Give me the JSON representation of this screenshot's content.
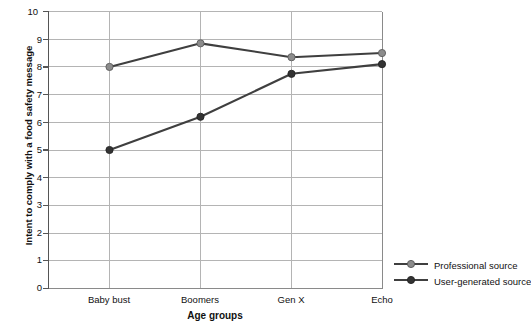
{
  "chart_data": {
    "type": "line",
    "title": "",
    "xlabel": "Age groups",
    "ylabel": "Intent to comply with a food safety message",
    "categories": [
      "Baby bust",
      "Boomers",
      "Gen X",
      "Echo"
    ],
    "ylim": [
      0,
      10
    ],
    "yticks": [
      "0",
      "1",
      "2",
      "3",
      "4",
      "5",
      "6",
      "7",
      "8",
      "9",
      "10"
    ],
    "grid": true,
    "legend_position": "right-bottom",
    "series": [
      {
        "name": "Professional source",
        "color": "#3f3f3f",
        "marker_color": "#8c8c8c",
        "values": [
          8.0,
          8.85,
          8.35,
          8.5
        ]
      },
      {
        "name": "User-generated source",
        "color": "#3f3f3f",
        "marker_color": "#333333",
        "values": [
          5.0,
          6.2,
          7.75,
          8.1
        ]
      }
    ]
  },
  "legend": {
    "items": [
      {
        "label": "Professional source"
      },
      {
        "label": "User-generated source"
      }
    ]
  },
  "colors": {
    "axis": "#6b6b6b",
    "grid": "#b4b4b4",
    "line": "#3f3f3f",
    "text": "#111111",
    "background": "#ffffff"
  }
}
